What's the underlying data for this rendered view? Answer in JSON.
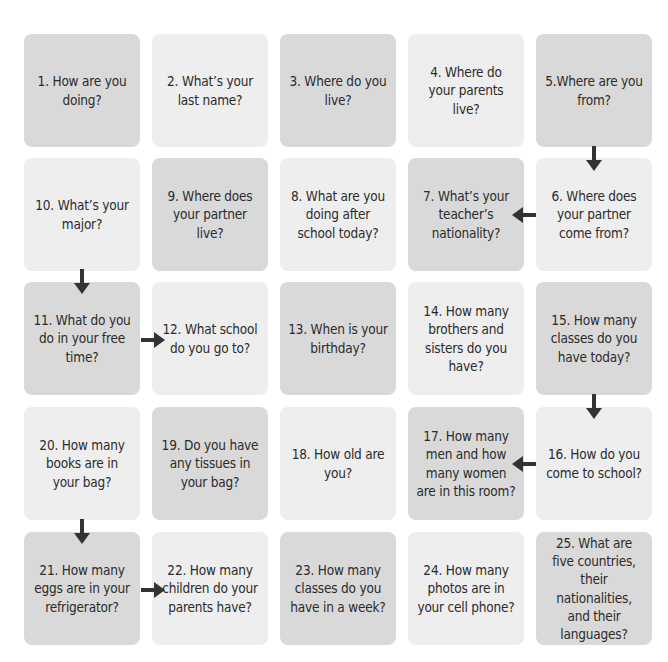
{
  "colors": {
    "dark_cell": "#d9d9d9",
    "light_cell": "#eeeeee",
    "arrow": "#333333",
    "text": "#2b2b2b"
  },
  "questions": {
    "q1": "1. How are you doing?",
    "q2": "2. What’s your last name?",
    "q3": "3. Where do you live?",
    "q4": "4. Where do your parents live?",
    "q5": "5.Where are you from?",
    "q6": "6. Where does your partner come from?",
    "q7": "7. What’s your teacher’s nationality?",
    "q8": "8. What are you doing after school today?",
    "q9": "9. Where does your partner live?",
    "q10": "10. What’s your major?",
    "q11": "11. What do you do in your free time?",
    "q12": "12. What school do you go to?",
    "q13": "13. When is your birthday?",
    "q14": "14. How many brothers and sisters do you have?",
    "q15": "15. How many classes do you have today?",
    "q16": "16. How do you come to school?",
    "q17": "17. How many men and how many women are in this room?",
    "q18": "18. How old are you?",
    "q19": "19. Do you have any tissues in your bag?",
    "q20": "20. How many books are in your bag?",
    "q21": "21. How many eggs are in your refrigerator?",
    "q22": "22. How many children do your parents have?",
    "q23": "23. How many classes do you have in a week?",
    "q24": "24. How many photos are in your cell phone?",
    "q25": "25. What are five countries, their nationalities, and their languages?"
  },
  "arrows": [
    {
      "from": 5,
      "to": 6,
      "direction": "down"
    },
    {
      "from": 6,
      "to": 7,
      "direction": "left"
    },
    {
      "from": 10,
      "to": 11,
      "direction": "down"
    },
    {
      "from": 11,
      "to": 12,
      "direction": "right"
    },
    {
      "from": 15,
      "to": 16,
      "direction": "down"
    },
    {
      "from": 16,
      "to": 17,
      "direction": "left"
    },
    {
      "from": 20,
      "to": 21,
      "direction": "down"
    },
    {
      "from": 21,
      "to": 22,
      "direction": "right"
    }
  ]
}
